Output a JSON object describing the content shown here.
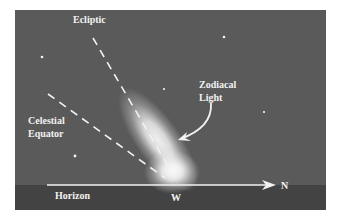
{
  "diagram": {
    "labels": {
      "ecliptic": "Ecliptic",
      "zodiacal_light_line1": "Zodiacal",
      "zodiacal_light_line2": "Light",
      "celestial_equator_line1": "Celestial",
      "celestial_equator_line2": "Equator",
      "horizon": "Horizon",
      "west": "W",
      "north": "N"
    },
    "colors": {
      "sky": "#5a5a5a",
      "ground": "#434343",
      "lines": "#f2f2f2",
      "glow": "#ffffff"
    },
    "stars": [
      {
        "x": 42,
        "y": 57
      },
      {
        "x": 224,
        "y": 37
      },
      {
        "x": 164,
        "y": 89
      },
      {
        "x": 264,
        "y": 112
      },
      {
        "x": 75,
        "y": 156
      }
    ]
  }
}
